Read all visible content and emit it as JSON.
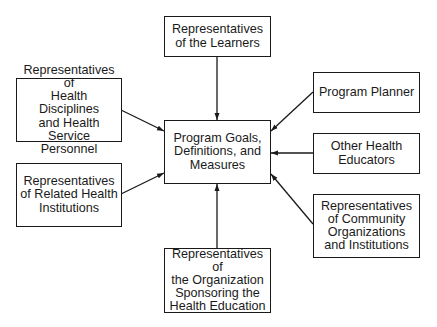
{
  "diagram": {
    "center": {
      "label": "Program Goals,\nDefinitions, and\nMeasures"
    },
    "nodes": [
      {
        "id": "learners",
        "label": "Representatives\nof the Learners"
      },
      {
        "id": "health-disciplines",
        "label": "Representatives of\nHealth Disciplines\nand Health Service\nPersonnel"
      },
      {
        "id": "related-institutions",
        "label": "Representatives\nof Related Health\nInstitutions"
      },
      {
        "id": "sponsoring-organization",
        "label": "Representatives of\nthe Organization\nSponsoring the\nHealth Education"
      },
      {
        "id": "program-planner",
        "label": "Program Planner"
      },
      {
        "id": "other-educators",
        "label": "Other Health\nEducators"
      },
      {
        "id": "community",
        "label": "Representatives\nof Community\nOrganizations\nand Institutions"
      }
    ],
    "edges": [
      {
        "from": "learners",
        "to": "center"
      },
      {
        "from": "health-disciplines",
        "to": "center"
      },
      {
        "from": "related-institutions",
        "to": "center"
      },
      {
        "from": "sponsoring-organization",
        "to": "center"
      },
      {
        "from": "program-planner",
        "to": "center"
      },
      {
        "from": "other-educators",
        "to": "center"
      },
      {
        "from": "community",
        "to": "center"
      }
    ],
    "colors": {
      "stroke": "#1a1a1a",
      "background": "#ffffff"
    }
  }
}
